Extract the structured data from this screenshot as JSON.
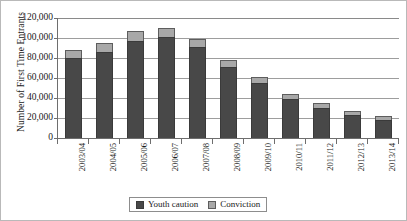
{
  "chart_data": {
    "type": "bar",
    "stacked": true,
    "title": "",
    "xlabel": "",
    "ylabel": "Number of First Time Entrants",
    "ylim": [
      0,
      120000
    ],
    "ytick_step": 20000,
    "ytick_labels": [
      "120,000",
      "100,000",
      "80,000",
      "60,000",
      "40,000",
      "20,000",
      "0"
    ],
    "ytick_values": [
      120000,
      100000,
      80000,
      60000,
      40000,
      20000,
      0
    ],
    "grid": "horizontal",
    "legend_position": "bottom-center",
    "categories": [
      "2003/04",
      "2004/05",
      "2005/06",
      "2006/07",
      "2007/08",
      "2008/09",
      "2009/10",
      "2010/11",
      "2011/12",
      "2012/13",
      "2013/14"
    ],
    "series": [
      {
        "name": "Youth caution",
        "color": "#484848",
        "values": [
          80000,
          86000,
          97500,
          101000,
          91000,
          71000,
          55000,
          39500,
          30500,
          23000,
          18500
        ]
      },
      {
        "name": "Conviction",
        "color": "#a8a8a8",
        "values": [
          8000,
          9500,
          9500,
          9500,
          8500,
          7500,
          6500,
          5000,
          5000,
          4000,
          3500
        ]
      }
    ],
    "totals": [
      88000,
      95500,
      107000,
      110500,
      99500,
      78500,
      61500,
      44500,
      35500,
      27000,
      22000
    ]
  },
  "legend": {
    "items": [
      {
        "label": "Youth caution",
        "swatch": "caution-swatch"
      },
      {
        "label": "Conviction",
        "swatch": "conviction-swatch"
      }
    ]
  }
}
